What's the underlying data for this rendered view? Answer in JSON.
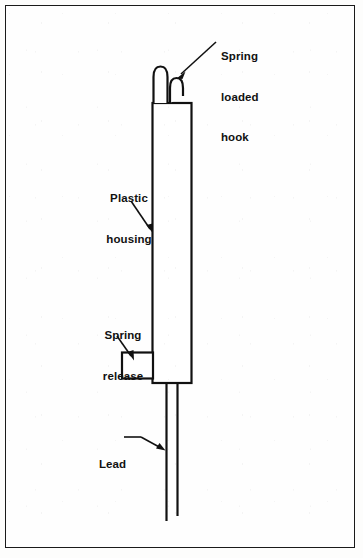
{
  "figure": {
    "background_color": "#fefefe",
    "line_color": "#111111",
    "border_color": "#1a1a1a"
  },
  "labels": {
    "spring_loaded_hook": {
      "line1": "Spring",
      "line2": "loaded",
      "line3": "hook"
    },
    "plastic_housing": {
      "line1": "Plastic",
      "line2": "housing"
    },
    "spring_release": {
      "line1": "Spring",
      "line2": "release"
    },
    "lead": {
      "line1": "Lead"
    }
  },
  "parts": [
    {
      "name": "spring-loaded-hook",
      "description": "Two curved prongs at top of housing forming a spring loaded hook"
    },
    {
      "name": "plastic-housing",
      "description": "Tall narrow vertical rectangular body"
    },
    {
      "name": "spring-release",
      "description": "Small rectangular tab protruding from lower left of housing"
    },
    {
      "name": "lead",
      "description": "Two parallel wires exiting the bottom of the housing"
    }
  ]
}
